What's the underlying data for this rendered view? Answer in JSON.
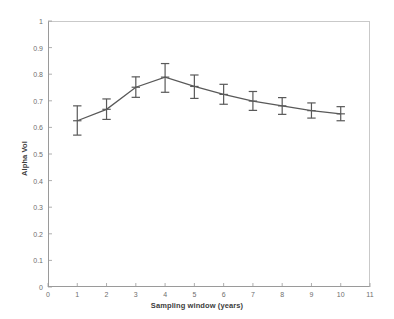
{
  "chart_data": {
    "type": "line",
    "title": "",
    "xlabel": "Sampling window (years)",
    "ylabel": "Alpha Vol",
    "xlim": [
      0,
      11
    ],
    "ylim": [
      0,
      1
    ],
    "grid": false,
    "legend": null,
    "xticks": [
      "0",
      "1",
      "2",
      "3",
      "4",
      "5",
      "6",
      "7",
      "8",
      "9",
      "10",
      "11"
    ],
    "yticks": [
      "0",
      "0.1",
      "0.2",
      "0.3",
      "0.4",
      "0.5",
      "0.6",
      "0.7",
      "0.8",
      "0.9",
      "1"
    ],
    "x": [
      1,
      2,
      3,
      4,
      5,
      6,
      7,
      8,
      9,
      10
    ],
    "values": [
      0.625,
      0.668,
      0.751,
      0.789,
      0.754,
      0.724,
      0.699,
      0.681,
      0.663,
      0.651
    ],
    "error_low": [
      0.571,
      0.63,
      0.713,
      0.732,
      0.709,
      0.687,
      0.664,
      0.649,
      0.635,
      0.625
    ],
    "error_high": [
      0.681,
      0.707,
      0.79,
      0.84,
      0.797,
      0.762,
      0.735,
      0.712,
      0.692,
      0.678
    ],
    "series_color": "#595959",
    "axis_color": "#9a9a9a",
    "tick_text_color": "#6e6e6e",
    "background": "#ffffff"
  }
}
